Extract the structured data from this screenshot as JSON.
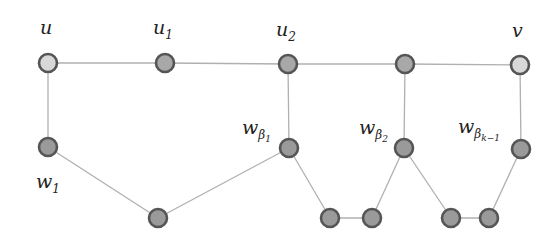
{
  "diagram": {
    "type": "graph",
    "nodes": [
      {
        "id": "u",
        "label": "u",
        "x": 48,
        "y": 63,
        "fill": "#d8d8d8"
      },
      {
        "id": "u1",
        "label": "u1",
        "x": 165,
        "y": 63,
        "fill": "#a8a8a8"
      },
      {
        "id": "u2",
        "label": "u2",
        "x": 288,
        "y": 64,
        "fill": "#a8a8a8"
      },
      {
        "id": "x3",
        "label": "",
        "x": 405,
        "y": 64,
        "fill": "#a8a8a8"
      },
      {
        "id": "v",
        "label": "v",
        "x": 520,
        "y": 65,
        "fill": "#d8d8d8"
      },
      {
        "id": "w1",
        "label": "w1",
        "x": 48,
        "y": 147,
        "fill": "#9a9a9a"
      },
      {
        "id": "m1",
        "label": "",
        "x": 158,
        "y": 218,
        "fill": "#9a9a9a"
      },
      {
        "id": "wb1",
        "label": "w_beta1",
        "x": 289,
        "y": 148,
        "fill": "#9a9a9a"
      },
      {
        "id": "a",
        "label": "",
        "x": 330,
        "y": 218,
        "fill": "#9a9a9a"
      },
      {
        "id": "b",
        "label": "",
        "x": 372,
        "y": 218,
        "fill": "#9a9a9a"
      },
      {
        "id": "wb2",
        "label": "w_beta2",
        "x": 404,
        "y": 148,
        "fill": "#9a9a9a"
      },
      {
        "id": "c",
        "label": "",
        "x": 451,
        "y": 218,
        "fill": "#9a9a9a"
      },
      {
        "id": "d",
        "label": "",
        "x": 489,
        "y": 218,
        "fill": "#9a9a9a"
      },
      {
        "id": "wbk",
        "label": "w_beta_k-1",
        "x": 521,
        "y": 149,
        "fill": "#9a9a9a"
      }
    ],
    "edges": [
      [
        "u",
        "u1"
      ],
      [
        "u1",
        "u2"
      ],
      [
        "u2",
        "x3"
      ],
      [
        "x3",
        "v"
      ],
      [
        "u",
        "w1"
      ],
      [
        "w1",
        "m1"
      ],
      [
        "m1",
        "wb1"
      ],
      [
        "wb1",
        "u2"
      ],
      [
        "wb1",
        "a"
      ],
      [
        "a",
        "b"
      ],
      [
        "b",
        "wb2"
      ],
      [
        "wb2",
        "x3"
      ],
      [
        "wb2",
        "c"
      ],
      [
        "c",
        "d"
      ],
      [
        "d",
        "wbk"
      ],
      [
        "wbk",
        "v"
      ]
    ],
    "labels": {
      "u": "u",
      "u1_base": "u",
      "u1_sub": "1",
      "u2_base": "u",
      "u2_sub": "2",
      "v": "v",
      "w1_base": "w",
      "w1_sub": "1",
      "wb1_base": "w",
      "wb1_sub": "β",
      "wb1_subsub": "1",
      "wb2_base": "w",
      "wb2_sub": "β",
      "wb2_subsub": "2",
      "wbk_base": "w",
      "wbk_sub": "β",
      "wbk_subsub": "k−1"
    },
    "colors": {
      "edge": "#b0b0b0",
      "node_stroke": "#555555",
      "endpoint_fill": "#d8d8d8",
      "node_fill": "#a0a0a0"
    }
  }
}
